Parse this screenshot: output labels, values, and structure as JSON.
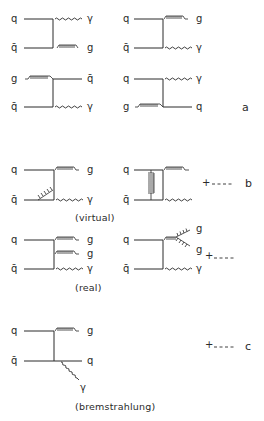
{
  "figure": {
    "groups": [
      {
        "id": "a",
        "tag": "a",
        "diagrams": [
          {
            "name": "qqbar-to-gamma-g-1",
            "in_top": "q",
            "in_bot": "q̄",
            "out_top": "γ",
            "out_bot": "g"
          },
          {
            "name": "qqbar-to-g-gamma-2",
            "in_top": "q",
            "in_bot": "q̄",
            "out_top": "g",
            "out_bot": "γ"
          },
          {
            "name": "gqbar-to-qbar-gamma",
            "in_top": "g",
            "in_bot": "q̄",
            "out_top": "q̄",
            "out_bot": "γ"
          },
          {
            "name": "qg-to-gamma-q",
            "in_top": "q",
            "in_bot": "g",
            "out_top": "γ",
            "out_bot": "q"
          }
        ]
      },
      {
        "id": "b",
        "tag": "b",
        "continuation": "+ ----",
        "virtual": {
          "caption": "(virtual)",
          "diagrams": [
            {
              "name": "virtual-vertex-correction",
              "in_top": "q",
              "in_bot": "q̄",
              "out_top": "g",
              "out_bot": "γ"
            },
            {
              "name": "virtual-box",
              "in_top": "q",
              "in_bot": "q̄"
            }
          ]
        },
        "real": {
          "caption": "(real)",
          "continuation": "+ ----",
          "diagrams": [
            {
              "name": "real-two-gluon-emission",
              "in_top": "q",
              "in_bot": "q̄",
              "out_1": "g",
              "out_2": "g",
              "out_3": "γ"
            },
            {
              "name": "real-gluon-splitting",
              "in_top": "q",
              "in_bot": "q̄",
              "out_1": "g",
              "out_2": "g",
              "out_3": "γ"
            }
          ]
        }
      },
      {
        "id": "c",
        "tag": "c",
        "continuation": "+ ----",
        "caption": "(bremstrahlung)",
        "diagrams": [
          {
            "name": "bremsstrahlung",
            "in_top": "q",
            "in_bot": "q̄",
            "out_top": "g",
            "out_mid": "q",
            "out_photon": "γ"
          }
        ]
      }
    ]
  }
}
